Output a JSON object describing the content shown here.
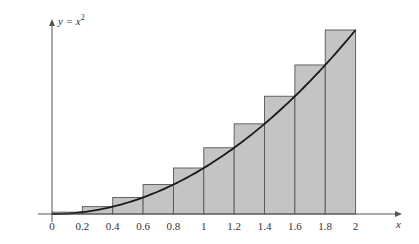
{
  "chart_data": {
    "type": "bar",
    "title": "",
    "curve_label": "y = x²",
    "curve_label_base": "y = x",
    "curve_label_exp": "2",
    "xlabel": "x",
    "ylabel": "",
    "xlim": [
      0,
      2
    ],
    "ylim": [
      0,
      4
    ],
    "x_ticks": [
      "0",
      "0.2",
      "0.4",
      "0.6",
      "0.8",
      "1",
      "1.2",
      "1.4",
      "1.6",
      "1.8",
      "2"
    ],
    "categories": [
      "[0,0.2]",
      "[0.2,0.4]",
      "[0.4,0.6]",
      "[0.6,0.8]",
      "[0.8,1]",
      "[1,1.2]",
      "[1.2,1.4]",
      "[1.4,1.6]",
      "[1.6,1.8]",
      "[1.8,2]"
    ],
    "values": [
      0.04,
      0.16,
      0.36,
      0.64,
      1.0,
      1.44,
      1.96,
      2.56,
      3.24,
      4.0
    ],
    "rect_method": "right-endpoint upper sum",
    "curve": {
      "function": "x^2",
      "x": [
        0,
        0.2,
        0.4,
        0.6,
        0.8,
        1,
        1.2,
        1.4,
        1.6,
        1.8,
        2
      ],
      "y": [
        0,
        0.04,
        0.16,
        0.36,
        0.64,
        1,
        1.44,
        1.96,
        2.56,
        3.24,
        4
      ]
    },
    "grid": false,
    "legend": "none",
    "colors": {
      "bar_fill": "#c4c4c4",
      "bar_stroke": "#555555",
      "curve": "#1a1a1a",
      "axis": "#555555"
    }
  }
}
